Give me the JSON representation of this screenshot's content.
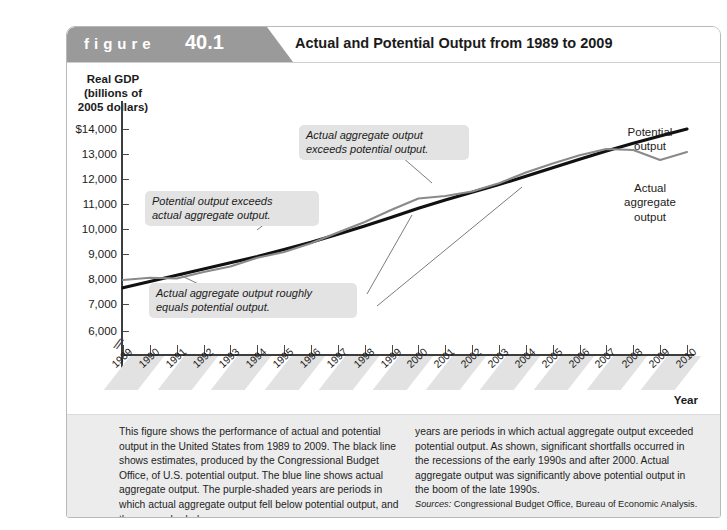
{
  "figure": {
    "word": "figure",
    "number": "40.1",
    "title": "Actual and Potential Output from 1989 to 2009"
  },
  "axes": {
    "y_title": "Real GDP\n(billions of\n2005 dollars)",
    "y_title_lines": [
      "Real GDP",
      "(billions of",
      "2005 dollars)"
    ],
    "y_ticks": [
      "$14,000",
      "13,000",
      "12,000",
      "11,000",
      "10,000",
      "9,000",
      "8,000",
      "7,000",
      "6,000"
    ],
    "x_label": "Year",
    "x_ticks": [
      "1989",
      "1990",
      "1991",
      "1992",
      "1993",
      "1994",
      "1995",
      "1996",
      "1997",
      "1998",
      "1999",
      "2000",
      "2001",
      "2002",
      "2003",
      "2004",
      "2005",
      "2006",
      "2007",
      "2008",
      "2009",
      "2010"
    ]
  },
  "callouts": {
    "potential_exceeds": "Potential output exceeds\nactual aggregate output.",
    "actual_exceeds": "Actual aggregate output\nexceeds potential output.",
    "roughly_equals": "Actual aggregate output roughly\nequals potential output."
  },
  "series_labels": {
    "potential": "Potential\noutput",
    "actual": "Actual\naggregate\noutput"
  },
  "caption": {
    "left": "This figure shows the performance of actual and potential output in the United States from 1989 to 2009. The black line shows estimates, produced by the Congressional Budget Office, of U.S. potential output. The blue line shows actual aggregate output. The purple-shaded years are periods in which actual aggregate output fell below potential output, and the green shaded",
    "right": "years are periods in which actual aggregate output exceeded potential output. As shown, significant shortfalls occurred in the recessions of the early 1990s and after 2000. Actual aggregate output was significantly above potential output in the boom of the late 1990s.",
    "sources_label": "Sources:",
    "sources_text": " Congressional Budget Office, Bureau of Economic Analysis."
  },
  "colors": {
    "potential_line": "#111111",
    "actual_line": "#8a8a8a",
    "tag_band": "#9a9a9a",
    "callout_bg": "#e3e3e3",
    "caption_bg": "#ececec"
  },
  "chart_data": {
    "type": "line",
    "title": "Actual and Potential Output from 1989 to 2009",
    "xlabel": "Year",
    "ylabel": "Real GDP (billions of 2005 dollars)",
    "xlim": [
      1989,
      2010
    ],
    "ylim": [
      5600,
      14400
    ],
    "grid": false,
    "legend": "inline-labels-right",
    "x": [
      1989,
      1990,
      1991,
      1992,
      1993,
      1994,
      1995,
      1996,
      1997,
      1998,
      1999,
      2000,
      2001,
      2002,
      2003,
      2004,
      2005,
      2006,
      2007,
      2008,
      2009,
      2010
    ],
    "series": [
      {
        "name": "Potential output",
        "color": "#111111",
        "values": [
          7650,
          7900,
          8150,
          8400,
          8650,
          8900,
          9180,
          9470,
          9790,
          10120,
          10470,
          10830,
          11160,
          11470,
          11780,
          12110,
          12450,
          12790,
          13120,
          13430,
          13720,
          14000
        ]
      },
      {
        "name": "Actual aggregate output",
        "color": "#8a8a8a",
        "values": [
          7960,
          8050,
          8020,
          8280,
          8500,
          8850,
          9080,
          9430,
          9860,
          10280,
          10770,
          11220,
          11320,
          11500,
          11830,
          12260,
          12620,
          12950,
          13200,
          13160,
          12760,
          13080
        ]
      }
    ],
    "annotations": [
      {
        "text": "Potential output exceeds actual aggregate output.",
        "points_to_year": 1994
      },
      {
        "text": "Actual aggregate output exceeds potential output.",
        "points_to_year": 1999
      },
      {
        "text": "Actual aggregate output roughly equals potential output.",
        "points_to_year": 2002
      },
      {
        "text": "Actual aggregate output roughly equals potential output.",
        "points_to_year": 2006
      }
    ]
  }
}
